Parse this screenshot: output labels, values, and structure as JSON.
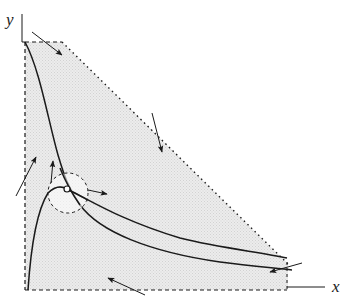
{
  "diagram": {
    "axes": {
      "x_label": "x",
      "y_label": "y"
    },
    "colors": {
      "region_fill": "#e6e6e6",
      "line": "#1a1a1a",
      "background": "#ffffff"
    },
    "elements": {
      "shaded_region": "feasible region bounded by dashed/dotted lines",
      "curves": [
        "decreasing curve",
        "hump curve"
      ],
      "equilibrium_point": "open circle at curve intersection",
      "neighborhood": "dashed circle around equilibrium point",
      "arrows": 7
    }
  }
}
